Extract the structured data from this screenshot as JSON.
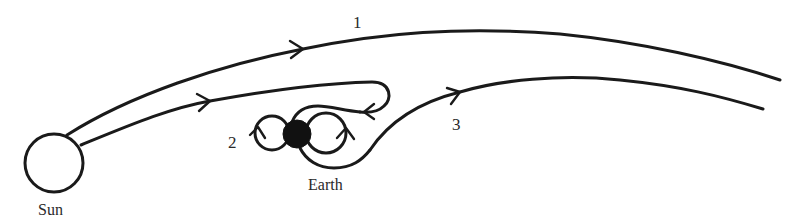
{
  "diagram": {
    "type": "trajectory-diagram",
    "colors": {
      "stroke": "#1a1a1a",
      "text": "#2a2a2a",
      "background": "#ffffff",
      "earth_fill": "#111111"
    },
    "bodies": [
      {
        "id": "sun",
        "label": "Sun",
        "shape": "hollow-circle"
      },
      {
        "id": "earth",
        "label": "Earth",
        "shape": "filled-circle"
      }
    ],
    "trajectories": [
      {
        "id": "1",
        "label": "1",
        "description": "Leaves the Sun and passes far above the Earth"
      },
      {
        "id": "2",
        "label": "2",
        "description": "Leaves the Sun, loops back and winds around the Earth in figure-eight loops"
      },
      {
        "id": "3",
        "label": "3",
        "description": "Departs from around the Earth and continues outward to the right"
      }
    ]
  },
  "labels": {
    "sun": "Sun",
    "earth": "Earth",
    "traj1": "1",
    "traj2": "2",
    "traj3": "3"
  }
}
